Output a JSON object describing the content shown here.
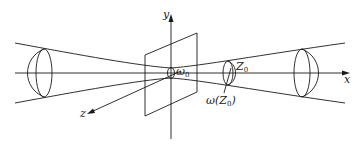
{
  "diagram": {
    "axes": {
      "x_label": "x",
      "y_label": "y",
      "z_label": "z"
    },
    "labels": {
      "waist": {
        "symbol": "ω",
        "subscript": "0"
      },
      "position": {
        "symbol": "Z",
        "subscript": "0"
      },
      "beam_radius": {
        "prefix": "ω(Z",
        "subscript": "0",
        "suffix": ")"
      }
    },
    "colors": {
      "stroke": "#1a1a1a",
      "background": "#ffffff"
    }
  }
}
